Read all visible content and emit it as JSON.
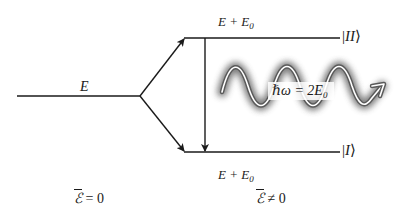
{
  "diagram": {
    "type": "energy-level-splitting",
    "left_level": {
      "label": "E"
    },
    "upper_level": {
      "label_main": "E + E",
      "label_sub": "0",
      "state": "II"
    },
    "lower_level": {
      "label_main": "E + E",
      "label_sub": "0",
      "state": "I"
    },
    "photon": {
      "label_main": "ℏω = 2E",
      "label_sub": "0"
    },
    "field_zero": {
      "symbol": "ℰ",
      "relation": "= 0"
    },
    "field_nonzero": {
      "symbol": "ℰ",
      "relation": "≠ 0"
    },
    "colors": {
      "line": "#1a1a1a",
      "wave_glow": "#6e6e6e",
      "wave_core": "#ffffff",
      "background": "#ffffff"
    }
  }
}
